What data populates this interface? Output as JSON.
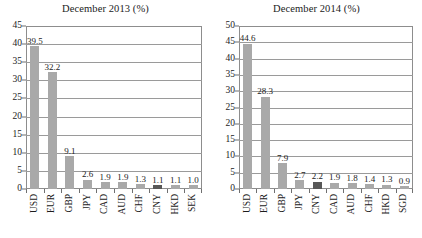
{
  "figure": {
    "panel_count": 2,
    "bar_color": "#a9a9a9",
    "highlight_color": "#585858",
    "frame_color": "#8d8d8d",
    "grid_color": "#9a9a9a"
  },
  "chart_data": [
    {
      "type": "bar",
      "title": "December 2013 (%)",
      "xlabel": "",
      "ylabel": "",
      "ylim": [
        0,
        45
      ],
      "ytick_step": 5,
      "yticks": [
        0,
        5,
        10,
        15,
        20,
        25,
        30,
        35,
        40,
        45
      ],
      "grid": true,
      "legend": "none",
      "highlight_category": "CNY",
      "categories": [
        "USD",
        "EUR",
        "GBP",
        "JPY",
        "CAD",
        "AUD",
        "CHF",
        "CNY",
        "HKD",
        "SEK"
      ],
      "values": [
        39.5,
        32.2,
        9.1,
        2.6,
        1.9,
        1.9,
        1.3,
        1.1,
        1.1,
        1.0
      ],
      "labels": [
        "39.5",
        "32.2",
        "9.1",
        "2.6",
        "1.9",
        "1.9",
        "1.3",
        "1.1",
        "1.1",
        "1.0"
      ]
    },
    {
      "type": "bar",
      "title": "December 2014 (%)",
      "xlabel": "",
      "ylabel": "",
      "ylim": [
        0,
        50
      ],
      "ytick_step": 5,
      "yticks": [
        0,
        5,
        10,
        15,
        20,
        25,
        30,
        35,
        40,
        45,
        50
      ],
      "grid": true,
      "legend": "none",
      "highlight_category": "CNY",
      "categories": [
        "USD",
        "EUR",
        "GBP",
        "JPY",
        "CNY",
        "CAD",
        "AUD",
        "CHF",
        "HKD",
        "SGD"
      ],
      "values": [
        44.6,
        28.3,
        7.9,
        2.7,
        2.2,
        1.9,
        1.8,
        1.4,
        1.3,
        0.9
      ],
      "labels": [
        "44.6",
        "28.3",
        "7.9",
        "2.7",
        "2.2",
        "1.9",
        "1.8",
        "1.4",
        "1.3",
        "0.9"
      ]
    }
  ]
}
